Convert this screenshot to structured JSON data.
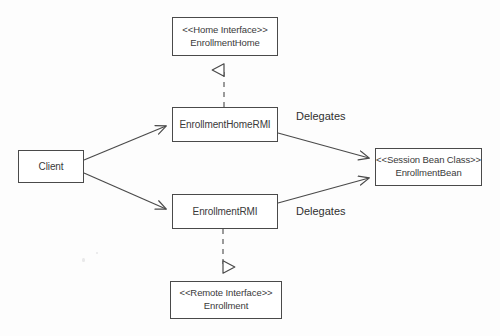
{
  "diagram": {
    "background_color": "#fdfdfd",
    "stroke_color": "#4a4a4a",
    "text_color": "#3a3a3a",
    "nodes": [
      {
        "id": "client",
        "name": "Client",
        "stereotype": "",
        "x": 18,
        "y": 150,
        "w": 66,
        "h": 33
      },
      {
        "id": "home-interface",
        "name": "EnrollmentHome",
        "stereotype": "<<Home Interface>>",
        "x": 172,
        "y": 17,
        "w": 106,
        "h": 39
      },
      {
        "id": "home-rmi",
        "name": "EnrollmentHomeRMI",
        "stereotype": "",
        "x": 172,
        "y": 107,
        "w": 106,
        "h": 35
      },
      {
        "id": "remote-rmi",
        "name": "EnrollmentRMI",
        "stereotype": "",
        "x": 172,
        "y": 194,
        "w": 106,
        "h": 35
      },
      {
        "id": "remote-interface",
        "name": "Enrollment",
        "stereotype": "<<Remote Interface>>",
        "x": 170,
        "y": 281,
        "w": 112,
        "h": 38
      },
      {
        "id": "session-bean",
        "name": "EnrollmentBean",
        "stereotype": "<<Session Bean Class>>",
        "x": 375,
        "y": 148,
        "w": 107,
        "h": 38
      }
    ],
    "edges": [
      {
        "id": "client-to-home-rmi",
        "from": "client",
        "to": "home-rmi",
        "style": "solid",
        "arrowhead": "open",
        "label": ""
      },
      {
        "id": "client-to-remote-rmi",
        "from": "client",
        "to": "remote-rmi",
        "style": "solid",
        "arrowhead": "open",
        "label": ""
      },
      {
        "id": "home-rmi-to-session-bean",
        "from": "home-rmi",
        "to": "session-bean",
        "style": "solid",
        "arrowhead": "open",
        "label": "Delegates"
      },
      {
        "id": "remote-rmi-to-session-bean",
        "from": "remote-rmi",
        "to": "session-bean",
        "style": "solid",
        "arrowhead": "open",
        "label": "Delegates"
      },
      {
        "id": "home-rmi-realizes-home-interface",
        "from": "home-rmi",
        "to": "home-interface",
        "style": "dashed",
        "arrowhead": "hollow-triangle",
        "label": ""
      },
      {
        "id": "remote-rmi-realizes-remote-interface",
        "from": "remote-rmi",
        "to": "remote-interface",
        "style": "dashed",
        "arrowhead": "hollow-triangle",
        "label": ""
      }
    ],
    "labels": [
      {
        "id": "delegates-top",
        "text": "Delegates",
        "x": 296,
        "y": 110
      },
      {
        "id": "delegates-bottom",
        "text": "Delegates",
        "x": 296,
        "y": 205
      }
    ]
  }
}
